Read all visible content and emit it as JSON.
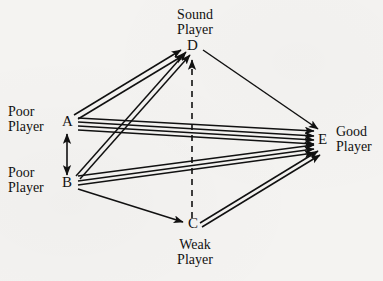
{
  "diagram": {
    "title": "",
    "background_color": "#f4f3f1",
    "stroke_color": "#111111",
    "nodes": [
      {
        "id": "A",
        "label": "A",
        "role": "Poor\nPlayer",
        "role_line1": "Poor",
        "role_line2": "Player",
        "x": 68,
        "y": 122
      },
      {
        "id": "B",
        "label": "B",
        "role": "Poor\nPlayer",
        "role_line1": "Poor",
        "role_line2": "Player",
        "x": 68,
        "y": 183
      },
      {
        "id": "C",
        "label": "C",
        "role": "Weak\nPlayer",
        "role_line1": "Weak",
        "role_line2": "Player",
        "x": 192,
        "y": 224
      },
      {
        "id": "D",
        "label": "D",
        "role": "Sound\nPlayer",
        "role_line1": "Sound",
        "role_line2": "Player",
        "x": 191,
        "y": 46
      },
      {
        "id": "E",
        "label": "E",
        "role": "Good\nPlayer",
        "role_line1": "Good",
        "role_line2": "Player",
        "x": 322,
        "y": 140
      }
    ],
    "edges": [
      {
        "from": "A",
        "to": "D",
        "style": "solid",
        "multiplicity": 2,
        "arrow": "to"
      },
      {
        "from": "B",
        "to": "D",
        "style": "solid",
        "multiplicity": 2,
        "arrow": "to"
      },
      {
        "from": "A",
        "to": "E",
        "style": "solid",
        "multiplicity": 4,
        "arrow": "to"
      },
      {
        "from": "B",
        "to": "E",
        "style": "solid",
        "multiplicity": 3,
        "arrow": "to"
      },
      {
        "from": "D",
        "to": "E",
        "style": "solid",
        "multiplicity": 1,
        "arrow": "to"
      },
      {
        "from": "B",
        "to": "C",
        "style": "solid",
        "multiplicity": 1,
        "arrow": "to"
      },
      {
        "from": "C",
        "to": "E",
        "style": "solid",
        "multiplicity": 2,
        "arrow": "to"
      },
      {
        "from": "C",
        "to": "D",
        "style": "dashed",
        "multiplicity": 1,
        "arrow": "to"
      },
      {
        "from": "A",
        "to": "B",
        "style": "solid",
        "multiplicity": 1,
        "arrow": "both"
      }
    ],
    "labels": {
      "node_a": "A",
      "node_b": "B",
      "node_c": "C",
      "node_d": "D",
      "node_e": "E",
      "sound_player_l1": "Sound",
      "sound_player_l2": "Player",
      "poor_player_a_l1": "Poor",
      "poor_player_a_l2": "Player",
      "poor_player_b_l1": "Poor",
      "poor_player_b_l2": "Player",
      "weak_player_l1": "Weak",
      "weak_player_l2": "Player",
      "good_player_l1": "Good",
      "good_player_l2": "Player"
    }
  }
}
